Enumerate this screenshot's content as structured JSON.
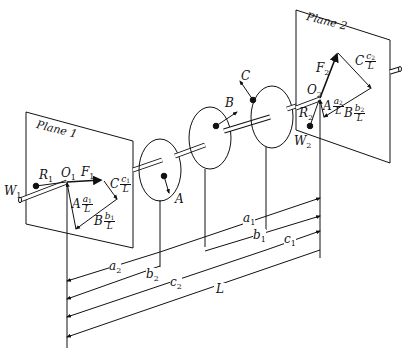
{
  "figure": {
    "planes": [
      {
        "name": "Plane 1",
        "origin": "O",
        "origin_sub": "1",
        "force": "F",
        "force_sub": "1",
        "reaction": "R",
        "reaction_sub": "1",
        "weight": "W",
        "weight_sub": "1"
      },
      {
        "name": "Plane 2",
        "origin": "O",
        "origin_sub": "2",
        "force": "F",
        "force_sub": "2",
        "reaction": "R",
        "reaction_sub": "2",
        "weight": "W",
        "weight_sub": "2"
      }
    ],
    "masses": [
      "A",
      "B",
      "C"
    ],
    "vectors_plane1": [
      {
        "mass": "A",
        "num": "a",
        "sub": "1",
        "den": "L"
      },
      {
        "mass": "B",
        "num": "b",
        "sub": "1",
        "den": "L"
      },
      {
        "mass": "C",
        "num": "c",
        "sub": "1",
        "den": "L"
      }
    ],
    "vectors_plane2": [
      {
        "mass": "A",
        "num": "a",
        "sub": "2",
        "den": "L"
      },
      {
        "mass": "B",
        "num": "b",
        "sub": "2",
        "den": "L"
      },
      {
        "mass": "C",
        "num": "c",
        "sub": "2",
        "den": "L"
      }
    ],
    "dimensions": [
      {
        "sym": "a",
        "sub": "1"
      },
      {
        "sym": "b",
        "sub": "1"
      },
      {
        "sym": "c",
        "sub": "1"
      },
      {
        "sym": "a",
        "sub": "2"
      },
      {
        "sym": "b",
        "sub": "2"
      },
      {
        "sym": "c",
        "sub": "2"
      },
      {
        "sym": "L",
        "sub": ""
      }
    ]
  }
}
